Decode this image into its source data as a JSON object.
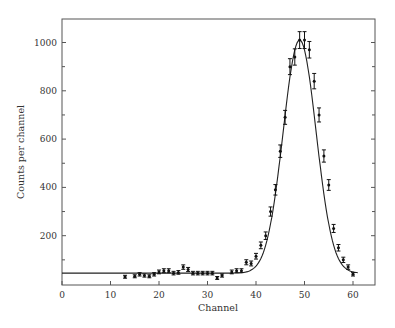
{
  "chart_data": {
    "type": "scatter",
    "title": "",
    "xlabel": "Channel",
    "ylabel": "Counts per channel",
    "xlim": [
      0,
      65
    ],
    "ylim": [
      0,
      1100
    ],
    "x_ticks": [
      0,
      10,
      20,
      30,
      40,
      50,
      60
    ],
    "y_ticks": [
      200,
      400,
      600,
      800,
      1000
    ],
    "y_minor_ticks": [
      100,
      300,
      500,
      700,
      900
    ],
    "grid": false,
    "legend": null,
    "series": [
      {
        "name": "Measured counts (with error bars)",
        "style": "points-with-error-bars",
        "x": [
          13,
          15,
          16,
          17,
          18,
          19,
          20,
          21,
          22,
          23,
          24,
          25,
          26,
          27,
          28,
          29,
          30,
          31,
          32,
          33,
          35,
          36,
          37,
          38,
          39,
          40,
          41,
          42,
          43,
          44,
          45,
          46,
          47,
          48,
          49,
          50,
          51,
          52,
          53,
          54,
          55,
          56,
          57,
          58,
          59,
          60
        ],
        "values": [
          30,
          32,
          40,
          35,
          32,
          40,
          50,
          55,
          55,
          45,
          48,
          70,
          60,
          45,
          45,
          45,
          45,
          45,
          25,
          35,
          50,
          55,
          55,
          90,
          85,
          115,
          160,
          200,
          300,
          390,
          550,
          690,
          900,
          940,
          1010,
          1010,
          970,
          840,
          700,
          530,
          410,
          230,
          150,
          100,
          70,
          40
        ]
      },
      {
        "name": "Fit (Gaussian peak on flat background)",
        "style": "line",
        "background": 45,
        "peak_center": 49,
        "peak_height": 1010,
        "sigma": 3.4,
        "x_range": [
          0,
          61
        ]
      }
    ]
  }
}
